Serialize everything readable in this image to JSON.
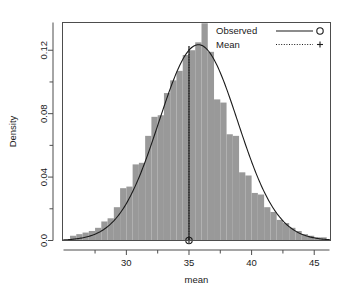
{
  "chart_data": {
    "type": "histogram",
    "title": "",
    "xlabel": "mean",
    "ylabel": "Density",
    "xlim": [
      24.9,
      46.3
    ],
    "ylim": [
      0.0,
      0.1375
    ],
    "grid": false,
    "xticks": [
      30,
      35,
      40,
      45
    ],
    "xticklabels": [
      "30",
      "35",
      "40",
      "45"
    ],
    "xminorticks": [
      27.5,
      32.5,
      37.5,
      42.5
    ],
    "yticks": [
      0.0,
      0.04,
      0.08,
      0.12
    ],
    "yticklabels": [
      "0.0",
      "0.04",
      "0.08",
      "0.12"
    ],
    "yminorticks": [
      0.02,
      0.06,
      0.1,
      0.14
    ],
    "bar_color": "#999999",
    "line_color": "#1a1a1a",
    "bin_width": 0.5,
    "bins": [
      {
        "x0": 25.5,
        "x1": 26.0,
        "density": 0.003
      },
      {
        "x0": 26.0,
        "x1": 26.5,
        "density": 0.004
      },
      {
        "x0": 26.5,
        "x1": 27.0,
        "density": 0.005
      },
      {
        "x0": 27.0,
        "x1": 27.5,
        "density": 0.006
      },
      {
        "x0": 27.5,
        "x1": 28.0,
        "density": 0.008
      },
      {
        "x0": 28.0,
        "x1": 28.5,
        "density": 0.012
      },
      {
        "x0": 28.5,
        "x1": 29.0,
        "density": 0.014
      },
      {
        "x0": 29.0,
        "x1": 29.5,
        "density": 0.021
      },
      {
        "x0": 29.5,
        "x1": 30.0,
        "density": 0.033
      },
      {
        "x0": 30.0,
        "x1": 30.5,
        "density": 0.034
      },
      {
        "x0": 30.5,
        "x1": 31.0,
        "density": 0.048
      },
      {
        "x0": 31.0,
        "x1": 31.5,
        "density": 0.049
      },
      {
        "x0": 31.5,
        "x1": 32.0,
        "density": 0.066
      },
      {
        "x0": 32.0,
        "x1": 32.5,
        "density": 0.078
      },
      {
        "x0": 32.5,
        "x1": 33.0,
        "density": 0.079
      },
      {
        "x0": 33.0,
        "x1": 33.5,
        "density": 0.093
      },
      {
        "x0": 33.5,
        "x1": 34.0,
        "density": 0.101
      },
      {
        "x0": 34.0,
        "x1": 34.5,
        "density": 0.107
      },
      {
        "x0": 34.5,
        "x1": 35.0,
        "density": 0.117
      },
      {
        "x0": 35.0,
        "x1": 35.5,
        "density": 0.12
      },
      {
        "x0": 35.5,
        "x1": 36.0,
        "density": 0.125
      },
      {
        "x0": 36.0,
        "x1": 36.5,
        "density": 0.137
      },
      {
        "x0": 36.5,
        "x1": 37.0,
        "density": 0.119
      },
      {
        "x0": 37.0,
        "x1": 37.5,
        "density": 0.089
      },
      {
        "x0": 37.5,
        "x1": 38.0,
        "density": 0.087
      },
      {
        "x0": 38.0,
        "x1": 38.5,
        "density": 0.067
      },
      {
        "x0": 38.5,
        "x1": 39.0,
        "density": 0.066
      },
      {
        "x0": 39.0,
        "x1": 39.5,
        "density": 0.043
      },
      {
        "x0": 39.5,
        "x1": 40.0,
        "density": 0.041
      },
      {
        "x0": 40.0,
        "x1": 40.5,
        "density": 0.03
      },
      {
        "x0": 40.5,
        "x1": 41.0,
        "density": 0.029
      },
      {
        "x0": 41.0,
        "x1": 41.5,
        "density": 0.021
      },
      {
        "x0": 41.5,
        "x1": 42.0,
        "density": 0.018
      },
      {
        "x0": 42.0,
        "x1": 42.5,
        "density": 0.013
      },
      {
        "x0": 42.5,
        "x1": 43.0,
        "density": 0.011
      },
      {
        "x0": 43.0,
        "x1": 43.5,
        "density": 0.008
      },
      {
        "x0": 43.5,
        "x1": 44.0,
        "density": 0.006
      },
      {
        "x0": 44.0,
        "x1": 44.5,
        "density": 0.004
      },
      {
        "x0": 44.5,
        "x1": 45.0,
        "density": 0.003
      },
      {
        "x0": 45.0,
        "x1": 45.5,
        "density": 0.002
      },
      {
        "x0": 45.5,
        "x1": 46.0,
        "density": 0.002
      }
    ],
    "density_curve": {
      "name": "Observed",
      "mu": 35.75,
      "sigma": 3.15,
      "peak": 0.1235
    },
    "mean_marker": {
      "name": "Mean",
      "x": 35.0,
      "y_top": 0.1225,
      "y_bottom": 0.0
    },
    "legend": {
      "position": "top-right",
      "entries": [
        {
          "label": "Observed",
          "style": "solid",
          "marker": "circle"
        },
        {
          "label": "Mean",
          "style": "dotted",
          "marker": "plus"
        }
      ]
    }
  }
}
